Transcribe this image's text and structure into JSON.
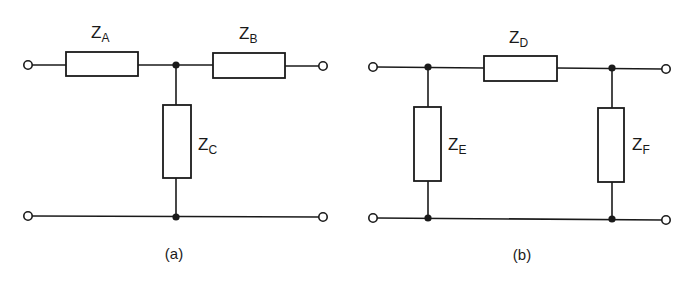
{
  "figure": {
    "circuits": [
      {
        "id": "a",
        "caption": "(a)",
        "topology": "T-network",
        "impedances": [
          {
            "symbol": "Z",
            "subscript": "A",
            "position": "series-left"
          },
          {
            "symbol": "Z",
            "subscript": "B",
            "position": "series-right"
          },
          {
            "symbol": "Z",
            "subscript": "C",
            "position": "shunt"
          }
        ]
      },
      {
        "id": "b",
        "caption": "(b)",
        "topology": "Pi-network",
        "impedances": [
          {
            "symbol": "Z",
            "subscript": "D",
            "position": "series"
          },
          {
            "symbol": "Z",
            "subscript": "E",
            "position": "shunt-left"
          },
          {
            "symbol": "Z",
            "subscript": "F",
            "position": "shunt-right"
          }
        ]
      }
    ]
  },
  "colors": {
    "line": "#1a1a1a",
    "background": "#ffffff"
  }
}
